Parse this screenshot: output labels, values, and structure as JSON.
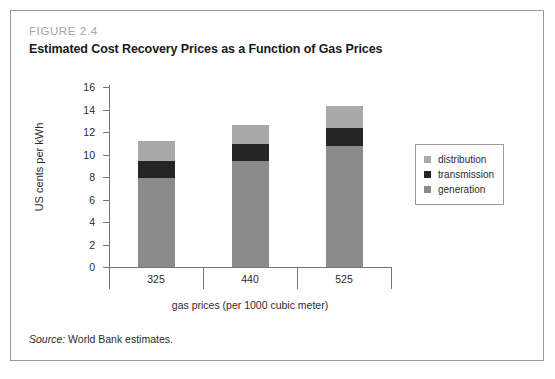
{
  "figure": {
    "number": "FIGURE 2.4",
    "title": "Estimated Cost Recovery Prices as a Function of Gas Prices",
    "source_label": "Source:",
    "source_text": "World Bank estimates."
  },
  "colors": {
    "distribution": "#a9a9a9",
    "transmission": "#252525",
    "generation": "#8b8b8b",
    "axis": "#767676",
    "frame": "#9a9a9a",
    "figure_number": "#a6a6a6",
    "text": "#2b2b2b"
  },
  "chart_data": {
    "type": "bar",
    "stacked": true,
    "title": "Estimated Cost Recovery Prices as a Function of Gas Prices",
    "subtitle": "FIGURE 2.4",
    "xlabel": "gas prices (per 1000 cubic meter)",
    "ylabel": "US cents per kWh",
    "categories": [
      "325",
      "440",
      "525"
    ],
    "ylim": [
      0,
      16
    ],
    "yticks": [
      0,
      2,
      4,
      6,
      8,
      10,
      12,
      14,
      16
    ],
    "ytick_labels": [
      "0",
      "2",
      "4",
      "6",
      "8",
      "10",
      "12",
      "14",
      "16"
    ],
    "grid": false,
    "legend_position": "right",
    "series": [
      {
        "name": "generation",
        "values": [
          7.9,
          9.4,
          10.8
        ]
      },
      {
        "name": "transmission",
        "values": [
          1.5,
          1.5,
          1.6
        ]
      },
      {
        "name": "distribution",
        "values": [
          1.8,
          1.7,
          1.9
        ]
      }
    ],
    "totals": [
      11.2,
      12.6,
      14.3
    ],
    "legend": [
      "distribution",
      "transmission",
      "generation"
    ]
  }
}
